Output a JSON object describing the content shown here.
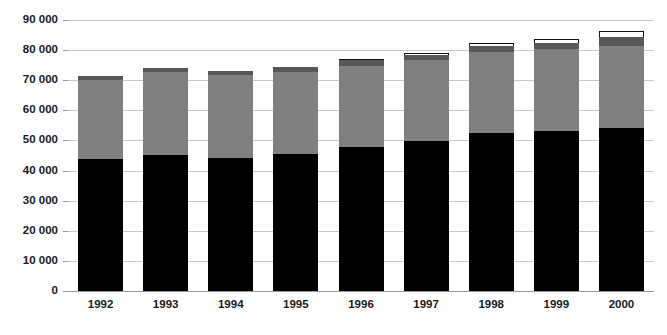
{
  "chart_data": {
    "type": "bar",
    "title": "",
    "subtitle": "",
    "xlabel": "",
    "ylabel": "",
    "stacked": true,
    "grid": true,
    "legend_position": "none",
    "categories": [
      "1992",
      "1993",
      "1994",
      "1995",
      "1996",
      "1997",
      "1998",
      "1999",
      "2000"
    ],
    "ylim": [
      0,
      90000
    ],
    "ytick_values": [
      0,
      10000,
      20000,
      30000,
      40000,
      50000,
      60000,
      70000,
      80000,
      90000
    ],
    "ytick_labels": [
      "0",
      "10 000",
      "20 000",
      "30 000",
      "40 000",
      "50 000",
      "60 000",
      "70 000",
      "80 000",
      "90 000"
    ],
    "series": [
      {
        "name": "segment-1-black",
        "color": "#000000",
        "values": [
          44000,
          45200,
          44200,
          45600,
          47800,
          49700,
          52400,
          53200,
          54000
        ]
      },
      {
        "name": "segment-2-gray",
        "color": "#808080",
        "values": [
          26000,
          27400,
          27500,
          27000,
          26800,
          26900,
          26900,
          27100,
          27500
        ]
      },
      {
        "name": "segment-3-dark-gray",
        "color": "#575757",
        "values": [
          1400,
          1400,
          1400,
          1800,
          2200,
          1700,
          2000,
          2100,
          2800
        ]
      },
      {
        "name": "segment-4-white",
        "color": "#ffffff",
        "values": [
          0,
          0,
          0,
          0,
          400,
          800,
          1000,
          1400,
          1900
        ]
      }
    ],
    "totals": [
      71400,
      74000,
      73100,
      74400,
      77200,
      79100,
      82300,
      83800,
      86200
    ]
  }
}
